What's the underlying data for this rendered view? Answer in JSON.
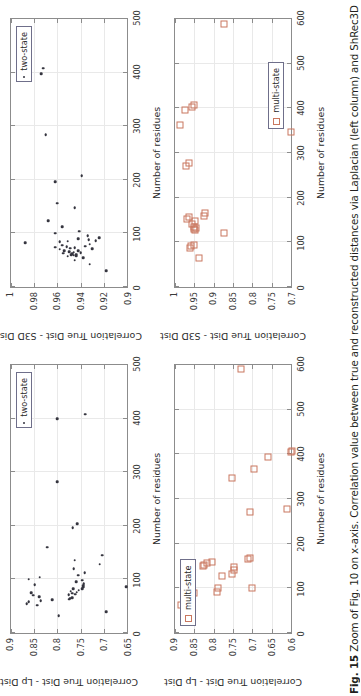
{
  "figure": {
    "caption_number": "Fig. 15",
    "caption_text": "Zoom of Fig. 10 on x-axis. Correlation value between true and reconstructed distances via Laplacian (left column) and ShRec3D (right",
    "accent_two_state": "#35353f",
    "accent_multi_state": "#c9775f"
  },
  "chart_data": [
    {
      "id": "panel-top-left",
      "type": "scatter",
      "title": "",
      "xlabel": "Number of residues",
      "ylabel": "Correlation True Dist - Lp Dist",
      "xlim": [
        0,
        500
      ],
      "ylim": [
        0.65,
        0.9
      ],
      "xticks": [
        "0",
        "100",
        "200",
        "300",
        "400",
        "500"
      ],
      "yticks": [
        "0.65",
        "0.7",
        "0.75",
        "0.8",
        "0.85",
        "0.9"
      ],
      "grid": true,
      "legend": {
        "position": "top-right",
        "entries": [
          "two-state"
        ]
      },
      "series": [
        {
          "name": "two-state",
          "marker": "dot",
          "color": "#35353f",
          "points": [
            [
              32,
              0.797
            ],
            [
              40,
              0.695
            ],
            [
              52,
              0.843
            ],
            [
              55,
              0.866
            ],
            [
              58,
              0.862
            ],
            [
              60,
              0.836
            ],
            [
              62,
              0.811
            ],
            [
              63,
              0.775
            ],
            [
              65,
              0.772
            ],
            [
              66,
              0.768
            ],
            [
              68,
              0.839
            ],
            [
              70,
              0.852
            ],
            [
              71,
              0.776
            ],
            [
              72,
              0.762
            ],
            [
              74,
              0.768
            ],
            [
              75,
              0.857
            ],
            [
              76,
              0.758
            ],
            [
              78,
              0.771
            ],
            [
              80,
              0.754
            ],
            [
              82,
              0.747
            ],
            [
              83,
              0.766
            ],
            [
              85,
              0.745
            ],
            [
              86,
              0.652
            ],
            [
              88,
              0.744
            ],
            [
              90,
              0.849
            ],
            [
              92,
              0.743
            ],
            [
              95,
              0.759
            ],
            [
              98,
              0.747
            ],
            [
              100,
              0.862
            ],
            [
              104,
              0.838
            ],
            [
              108,
              0.755
            ],
            [
              112,
              0.741
            ],
            [
              120,
              0.765
            ],
            [
              128,
              0.709
            ],
            [
              136,
              0.763
            ],
            [
              145,
              0.703
            ],
            [
              160,
              0.822
            ],
            [
              196,
              0.767
            ],
            [
              204,
              0.757
            ],
            [
              282,
              0.8
            ],
            [
              400,
              0.8
            ],
            [
              408,
              0.74
            ]
          ]
        }
      ]
    },
    {
      "id": "panel-top-right",
      "type": "scatter",
      "title": "",
      "xlabel": "Number of residues",
      "ylabel": "Correlation True Dist - S3D Dist",
      "xlim": [
        0,
        500
      ],
      "ylim": [
        0.9,
        1.0
      ],
      "xticks": [
        "0",
        "100",
        "200",
        "300",
        "400",
        "500"
      ],
      "yticks": [
        "0.9",
        "0.92",
        "0.94",
        "0.96",
        "0.98",
        "1"
      ],
      "grid": true,
      "legend": {
        "position": "top-right",
        "entries": [
          "two-state"
        ]
      },
      "series": [
        {
          "name": "two-state",
          "marker": "dot",
          "color": "#35353f",
          "points": [
            [
              30,
              0.918
            ],
            [
              42,
              0.932
            ],
            [
              50,
              0.945
            ],
            [
              55,
              0.938
            ],
            [
              57,
              0.951
            ],
            [
              58,
              0.944
            ],
            [
              59,
              0.946
            ],
            [
              60,
              0.948
            ],
            [
              61,
              0.944
            ],
            [
              62,
              0.947
            ],
            [
              63,
              0.955
            ],
            [
              64,
              0.94
            ],
            [
              65,
              0.946
            ],
            [
              66,
              0.95
            ],
            [
              67,
              0.942
            ],
            [
              68,
              0.954
            ],
            [
              70,
              0.958
            ],
            [
              71,
              0.93
            ],
            [
              72,
              0.949
            ],
            [
              73,
              0.945
            ],
            [
              74,
              0.962
            ],
            [
              75,
              0.952
            ],
            [
              76,
              0.936
            ],
            [
              78,
              0.956
            ],
            [
              80,
              0.932
            ],
            [
              82,
              0.988
            ],
            [
              84,
              0.958
            ],
            [
              85,
              0.951
            ],
            [
              86,
              0.927
            ],
            [
              88,
              0.933
            ],
            [
              90,
              0.942
            ],
            [
              92,
              0.924
            ],
            [
              95,
              0.934
            ],
            [
              100,
              0.962
            ],
            [
              104,
              0.941
            ],
            [
              112,
              0.956
            ],
            [
              124,
              0.968
            ],
            [
              148,
              0.945
            ],
            [
              156,
              0.96
            ],
            [
              196,
              0.962
            ],
            [
              208,
              0.939
            ],
            [
              284,
              0.97
            ],
            [
              398,
              0.974
            ],
            [
              408,
              0.972
            ]
          ]
        }
      ]
    },
    {
      "id": "panel-bottom-left",
      "type": "scatter",
      "title": "",
      "xlabel": "Number of residues",
      "ylabel": "Correlation True Dist - Lp Dist",
      "xlim": [
        0,
        600
      ],
      "ylim": [
        0.6,
        0.9
      ],
      "xticks": [
        "0",
        "100",
        "200",
        "300",
        "400",
        "500",
        "600"
      ],
      "yticks": [
        "0.6",
        "0.65",
        "0.7",
        "0.75",
        "0.8",
        "0.85",
        "0.9"
      ],
      "grid": true,
      "legend": {
        "position": "top-left",
        "entries": [
          "multi-state"
        ]
      },
      "series": [
        {
          "name": "multi-state",
          "marker": "square",
          "color": "#c9775f",
          "points": [
            [
              62,
              0.885
            ],
            [
              90,
              0.852
            ],
            [
              92,
              0.792
            ],
            [
              100,
              0.79
            ],
            [
              100,
              0.7
            ],
            [
              128,
              0.778
            ],
            [
              132,
              0.752
            ],
            [
              140,
              0.748
            ],
            [
              148,
              0.748
            ],
            [
              150,
              0.828
            ],
            [
              152,
              0.826
            ],
            [
              156,
              0.816
            ],
            [
              160,
              0.805
            ],
            [
              165,
              0.712
            ],
            [
              168,
              0.705
            ],
            [
              272,
              0.705
            ],
            [
              278,
              0.61
            ],
            [
              348,
              0.752
            ],
            [
              368,
              0.695
            ],
            [
              395,
              0.66
            ],
            [
              405,
              0.6
            ],
            [
              408,
              0.598
            ],
            [
              590,
              0.73
            ]
          ]
        }
      ]
    },
    {
      "id": "panel-bottom-right",
      "type": "scatter",
      "title": "",
      "xlabel": "Number of residues",
      "ylabel": "Correlation True Dist - S3D Dist",
      "xlim": [
        0,
        600
      ],
      "ylim": [
        0.7,
        1.0
      ],
      "xticks": [
        "0",
        "100",
        "200",
        "300",
        "400",
        "500",
        "600"
      ],
      "yticks": [
        "0.7",
        "0.75",
        "0.8",
        "0.85",
        "0.9",
        "0.95",
        "1"
      ],
      "grid": true,
      "legend": {
        "position": "bottom-right",
        "entries": [
          "multi-state"
        ]
      },
      "series": [
        {
          "name": "multi-state",
          "marker": "square",
          "color": "#c9775f",
          "points": [
            [
              66,
              0.938
            ],
            [
              88,
              0.962
            ],
            [
              92,
              0.958
            ],
            [
              95,
              0.952
            ],
            [
              122,
              0.872
            ],
            [
              128,
              0.948
            ],
            [
              130,
              0.952
            ],
            [
              132,
              0.946
            ],
            [
              134,
              0.95
            ],
            [
              140,
              0.956
            ],
            [
              148,
              0.948
            ],
            [
              152,
              0.968
            ],
            [
              156,
              0.963
            ],
            [
              160,
              0.925
            ],
            [
              165,
              0.922
            ],
            [
              272,
              0.972
            ],
            [
              278,
              0.963
            ],
            [
              348,
              0.7
            ],
            [
              362,
              0.988
            ],
            [
              396,
              0.975
            ],
            [
              402,
              0.955
            ],
            [
              408,
              0.952
            ],
            [
              588,
              0.872
            ]
          ]
        }
      ]
    }
  ]
}
